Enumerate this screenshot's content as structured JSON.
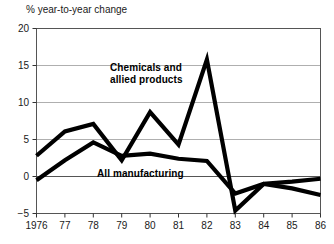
{
  "axis_title": "% year-to-year change",
  "chart_data": {
    "type": "line",
    "title": "",
    "subtitle": "",
    "xlabel": "",
    "ylabel": "% year-to-year change",
    "x": [
      1976,
      1977,
      1978,
      1979,
      1980,
      1981,
      1982,
      1983,
      1984,
      1985,
      1986
    ],
    "x_tick_labels": [
      "1976",
      "77",
      "78",
      "79",
      "80",
      "81",
      "82",
      "83",
      "84",
      "85",
      "86"
    ],
    "y_tick_labels": [
      "20",
      "15",
      "10",
      "5",
      "0",
      "−5"
    ],
    "y_ticks": [
      20,
      15,
      10,
      5,
      0,
      -5
    ],
    "xlim": [
      1976,
      1986
    ],
    "ylim": [
      -5,
      20
    ],
    "grid": "horizontal",
    "legend": "inline-annotations",
    "series": [
      {
        "name": "Chemicals and allied products",
        "label": "Chemicals and\nallied products",
        "color": "#000000",
        "values": [
          2.8,
          6.1,
          7.1,
          2.2,
          8.7,
          4.3,
          15.8,
          -4.6,
          -1.0,
          -1.6,
          -2.5
        ]
      },
      {
        "name": "All manufacturing",
        "label": "All manufacturing",
        "color": "#000000",
        "values": [
          -0.5,
          2.2,
          4.6,
          2.8,
          3.1,
          2.4,
          2.1,
          -2.3,
          -1.0,
          -0.7,
          -0.3
        ]
      }
    ]
  }
}
